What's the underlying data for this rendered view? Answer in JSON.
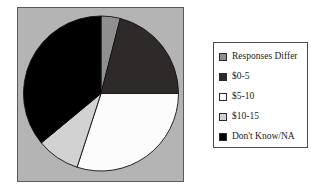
{
  "chart_data": {
    "type": "pie",
    "title": "",
    "subtitle": "",
    "xlabel": "",
    "ylabel": "",
    "grid": false,
    "legend_position": "right",
    "start_angle_deg": 0,
    "direction": "clockwise",
    "categories": [
      "Responses Differ",
      "$0-5",
      "$5-10",
      "$10-15",
      "Don't Know/NA"
    ],
    "values": [
      4,
      21,
      30,
      9,
      36
    ],
    "colors": [
      "#8f8f8f",
      "#2e2a2a",
      "#fcfcfc",
      "#d2d2d2",
      "#000000"
    ],
    "slices": [
      {
        "label": "Responses Differ",
        "value": 4,
        "color": "#8f8f8f"
      },
      {
        "label": "$0-5",
        "value": 21,
        "color": "#2e2a2a"
      },
      {
        "label": "$5-10",
        "value": 30,
        "color": "#fcfcfc"
      },
      {
        "label": "$10-15",
        "value": 9,
        "color": "#d2d2d2"
      },
      {
        "label": "Don't Know/NA",
        "value": 36,
        "color": "#000000"
      }
    ]
  },
  "plot": {
    "panel_color": "#b4b4b4",
    "panel_border_color": "#5a5a5a",
    "slice_edge_color": "#111111"
  },
  "legend": {
    "background": "#ffffff",
    "border_color": "#4a4a4a",
    "items": [
      {
        "label": "Responses Differ",
        "swatch": "#8f8f8f",
        "swatch_name": "legend-swatch-responses-differ"
      },
      {
        "label": "$0-5",
        "swatch": "#2e2a2a",
        "swatch_name": "legend-swatch-0-5"
      },
      {
        "label": "$5-10",
        "swatch": "#fcfcfc",
        "swatch_name": "legend-swatch-5-10"
      },
      {
        "label": "$10-15",
        "swatch": "#d2d2d2",
        "swatch_name": "legend-swatch-10-15"
      },
      {
        "label": "Don't Know/NA",
        "swatch": "#000000",
        "swatch_name": "legend-swatch-dont-know-na"
      }
    ]
  }
}
